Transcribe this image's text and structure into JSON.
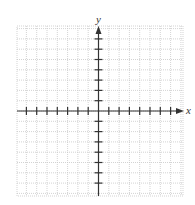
{
  "diagram": {
    "type": "coordinate-plane",
    "axes": {
      "x_label": "x",
      "y_label": "y",
      "x_ticks_left": 7,
      "x_ticks_right": 7,
      "y_ticks_up": 7,
      "y_ticks_down": 7
    },
    "grid": {
      "left": 17,
      "top": 26,
      "right": 183,
      "bottom": 196,
      "origin_x": 98.5,
      "origin_y": 111,
      "cell": 10.3,
      "line_color": "#c8c8c8",
      "axis_color": "#333333"
    }
  }
}
